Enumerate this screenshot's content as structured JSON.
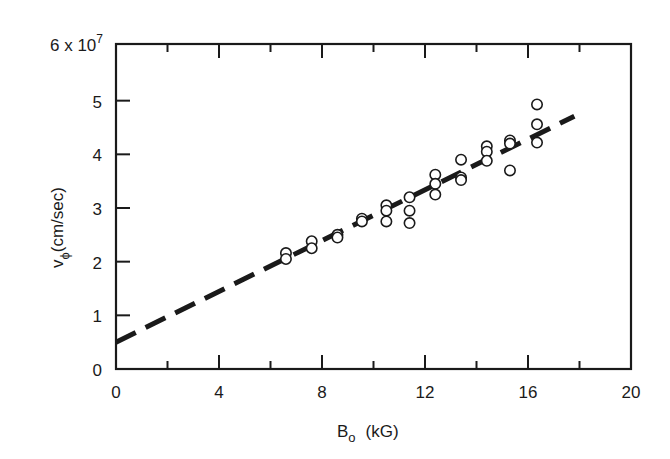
{
  "chart_data": {
    "type": "scatter",
    "title": "",
    "xlabel": "B_o (kG)",
    "xlabel_main": "B",
    "xlabel_sub": "o",
    "xlabel_unit": "(kG)",
    "ylabel": "v_phi (cm/sec)",
    "ylabel_main": "v",
    "ylabel_sub": "ϕ",
    "ylabel_unit": "(cm/sec)",
    "y_scale_note": "6 x 10^7",
    "y_scale_base": "6 x 10",
    "y_scale_exp": "7",
    "xlim": [
      0,
      20
    ],
    "ylim": [
      0,
      6
    ],
    "x_ticks_major": [
      0,
      4,
      8,
      12,
      16,
      20
    ],
    "x_tick_labels": [
      "0",
      "4",
      "8",
      "12",
      "16",
      "20"
    ],
    "x_ticks_minor": [
      2,
      6,
      10,
      14,
      18
    ],
    "y_ticks": [
      0,
      1,
      2,
      3,
      4,
      5
    ],
    "y_tick_labels": [
      "0",
      "1",
      "2",
      "3",
      "4",
      "5"
    ],
    "grid": false,
    "legend": null,
    "series": [
      {
        "name": "measured",
        "marker": "open-circle",
        "points": [
          [
            6.6,
            2.16
          ],
          [
            6.6,
            2.05
          ],
          [
            7.6,
            2.38
          ],
          [
            7.6,
            2.25
          ],
          [
            8.6,
            2.5
          ],
          [
            8.6,
            2.45
          ],
          [
            9.55,
            2.8
          ],
          [
            9.55,
            2.75
          ],
          [
            10.5,
            3.05
          ],
          [
            10.5,
            2.95
          ],
          [
            10.5,
            2.75
          ],
          [
            11.4,
            3.2
          ],
          [
            11.4,
            2.95
          ],
          [
            11.4,
            2.72
          ],
          [
            12.4,
            3.62
          ],
          [
            12.4,
            3.45
          ],
          [
            12.4,
            3.25
          ],
          [
            13.4,
            3.9
          ],
          [
            13.4,
            3.57
          ],
          [
            13.4,
            3.52
          ],
          [
            14.4,
            4.15
          ],
          [
            14.4,
            4.05
          ],
          [
            14.4,
            3.88
          ],
          [
            15.3,
            4.26
          ],
          [
            15.3,
            4.2
          ],
          [
            15.3,
            3.7
          ],
          [
            16.35,
            4.93
          ],
          [
            16.35,
            4.56
          ],
          [
            16.35,
            4.22
          ]
        ]
      },
      {
        "name": "linear fit",
        "style": "dashed",
        "points": [
          [
            0,
            0.5
          ],
          [
            17.8,
            4.71
          ]
        ]
      }
    ]
  }
}
